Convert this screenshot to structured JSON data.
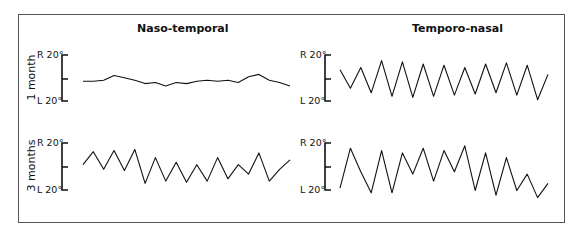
{
  "columns": [
    "Naso-temporal",
    "Temporo-nasal"
  ],
  "rows": [
    "1 month",
    "3 months"
  ],
  "axis": {
    "top": "R 20°",
    "bottom": "L 20°"
  },
  "chart_data": [
    {
      "type": "line",
      "title": "Naso-temporal",
      "row": "1 month",
      "ylabel": "1 month",
      "ylim": [
        -20,
        20
      ],
      "yticks": [
        "L 20°",
        "R 20°"
      ],
      "x": [
        0,
        5,
        10,
        15,
        20,
        25,
        30,
        35,
        40,
        45,
        50,
        55,
        60,
        65,
        70,
        75,
        80,
        85,
        90,
        95,
        100
      ],
      "values": [
        -2,
        -2,
        -1,
        3,
        1,
        -1,
        -4,
        -3,
        -6,
        -3,
        -4,
        -2,
        -1,
        -2,
        -1,
        -3,
        2,
        4,
        -1,
        -3,
        -6
      ]
    },
    {
      "type": "line",
      "title": "Temporo-nasal",
      "row": "1 month",
      "ylabel": "1 month",
      "ylim": [
        -20,
        20
      ],
      "yticks": [
        "L 20°",
        "R 20°"
      ],
      "x": [
        0,
        5,
        10,
        15,
        20,
        25,
        30,
        35,
        40,
        45,
        50,
        55,
        60,
        65,
        70,
        75,
        80,
        85,
        90,
        95,
        100
      ],
      "values": [
        8,
        -8,
        10,
        -12,
        16,
        -15,
        15,
        -16,
        13,
        -15,
        12,
        -14,
        10,
        -13,
        13,
        -12,
        14,
        -14,
        12,
        -18,
        4
      ]
    },
    {
      "type": "line",
      "title": "Naso-temporal",
      "row": "3 months",
      "ylabel": "3 months",
      "ylim": [
        -20,
        20
      ],
      "yticks": [
        "L 20°",
        "R 20°"
      ],
      "x": [
        0,
        5,
        10,
        15,
        20,
        25,
        30,
        35,
        40,
        45,
        50,
        55,
        60,
        65,
        70,
        75,
        80,
        85,
        90,
        95,
        100
      ],
      "values": [
        2,
        13,
        -2,
        14,
        -3,
        15,
        -14,
        8,
        -12,
        4,
        -13,
        2,
        -12,
        8,
        -10,
        2,
        -6,
        12,
        -12,
        -2,
        6
      ]
    },
    {
      "type": "line",
      "title": "Temporo-nasal",
      "row": "3 months",
      "ylabel": "3 months",
      "ylim": [
        -20,
        20
      ],
      "yticks": [
        "L 20°",
        "R 20°"
      ],
      "x": [
        0,
        5,
        10,
        15,
        20,
        25,
        30,
        35,
        40,
        45,
        50,
        55,
        60,
        65,
        70,
        75,
        80,
        85,
        90,
        95,
        100
      ],
      "values": [
        -18,
        16,
        -4,
        -22,
        14,
        -22,
        12,
        -6,
        16,
        -12,
        14,
        -4,
        18,
        -20,
        12,
        -24,
        8,
        -20,
        -6,
        -26,
        -14
      ]
    }
  ]
}
